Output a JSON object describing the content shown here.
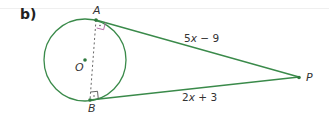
{
  "part_label": "b)",
  "points": {
    "A": "A",
    "B": "B",
    "O": "O",
    "P": "P"
  },
  "segments": {
    "AP": {
      "label": "5x − 9",
      "coef": "5",
      "var": "x",
      "rest": " − 9"
    },
    "BP": {
      "label": "2x + 3",
      "coef": "2",
      "var": "x",
      "rest": " + 3"
    }
  },
  "colors": {
    "stroke": "#3a8a4a",
    "dashed": "#666666"
  }
}
